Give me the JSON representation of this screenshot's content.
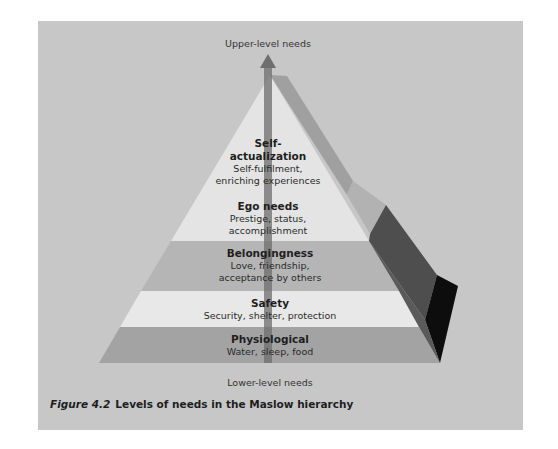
{
  "figure": {
    "top_label": "Upper-level needs",
    "bottom_label": "Lower-level needs",
    "caption_number": "Figure 4.2",
    "caption_text": "Levels of needs in the Maslow hierarchy"
  },
  "levels": [
    {
      "title": "Self-",
      "title2": "actualization",
      "desc1": "Self-fulfilment,",
      "desc2": "enriching experiences"
    },
    {
      "title": "Ego needs",
      "desc1": "Prestige, status,",
      "desc2": "accomplishment"
    },
    {
      "title": "Belongingness",
      "desc1": "Love, friendship,",
      "desc2": "acceptance by others"
    },
    {
      "title": "Safety",
      "desc1": "Security, shelter, protection"
    },
    {
      "title": "Physiological",
      "desc1": "Water, sleep, food"
    }
  ],
  "colors": {
    "background": "#c7c7c7",
    "top_band": "#e4e4e4",
    "belongingness": "#b4b4b4",
    "safety": "#e8e8e8",
    "physiological": "#a2a2a2",
    "arrow": "#7a7a7a"
  }
}
